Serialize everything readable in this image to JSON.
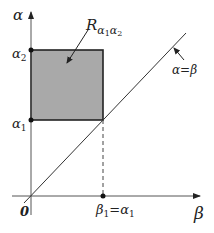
{
  "diagram": {
    "axes": {
      "y_label": "α",
      "x_label": "β",
      "origin_label": "0"
    },
    "ticks": {
      "alpha1": {
        "base": "α",
        "sub": "1"
      },
      "alpha2": {
        "base": "α",
        "sub": "2"
      },
      "beta1_eq_alpha1": {
        "base1": "β",
        "sub1": "1",
        "eq": "=",
        "base2": "α",
        "sub2": "1"
      }
    },
    "region": {
      "label_base": "R",
      "label_sub1_base": "α",
      "label_sub1_sub": "1",
      "label_sub2_base": "α",
      "label_sub2_sub": "2",
      "fill": "#a9a9a9",
      "stroke": "#222222"
    },
    "line": {
      "label": "α=β"
    }
  }
}
